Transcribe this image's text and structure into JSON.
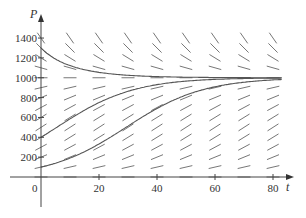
{
  "chart_data": {
    "type": "line",
    "title": "",
    "subtitle": "Direction field and solution curves of logistic equation dP/dt = kP(1 - P/K)",
    "xlabel": "t",
    "ylabel": "P",
    "xlim": [
      0,
      80
    ],
    "ylim": [
      0,
      1400
    ],
    "x_ticks": [
      0,
      20,
      40,
      60,
      80
    ],
    "x_tick_labels": [
      "0",
      "20",
      "40",
      "60",
      "80"
    ],
    "y_ticks": [
      200,
      400,
      600,
      800,
      1000,
      1200,
      1400
    ],
    "y_tick_labels": [
      "200",
      "400",
      "600",
      "800",
      "1000",
      "1200",
      "1400"
    ],
    "grid": false,
    "legend": null,
    "model": {
      "carrying_capacity": 1000,
      "k": 0.075
    },
    "direction_field": {
      "t_values": [
        0,
        10,
        20,
        30,
        40,
        50,
        60,
        70,
        80
      ],
      "P_values": [
        0,
        100,
        200,
        300,
        400,
        500,
        600,
        700,
        800,
        900,
        1000,
        1100,
        1200,
        1300,
        1400
      ]
    },
    "series": [
      {
        "name": "P(0)=1300",
        "initial": 1300,
        "x": [
          0,
          10,
          20,
          30,
          40,
          50,
          60,
          70,
          80
        ],
        "values": [
          1300,
          1122,
          1051,
          1022,
          1011,
          1005,
          1002,
          1001,
          1000
        ]
      },
      {
        "name": "P(0)=400",
        "initial": 400,
        "x": [
          0,
          10,
          20,
          30,
          40,
          50,
          60,
          70,
          80
        ],
        "values": [
          400,
          585,
          770,
          882,
          942,
          972,
          986,
          994,
          997
        ]
      },
      {
        "name": "P(0)=100",
        "initial": 100,
        "x": [
          0,
          10,
          20,
          30,
          40,
          50,
          60,
          70,
          80
        ],
        "values": [
          100,
          193,
          332,
          500,
          667,
          800,
          889,
          941,
          970
        ]
      }
    ],
    "colors": {
      "curve": "#555555",
      "field": "#777777",
      "axis": "#444444"
    }
  },
  "axes": {
    "x_label": "t",
    "y_label": "P",
    "origin_label": "0"
  }
}
